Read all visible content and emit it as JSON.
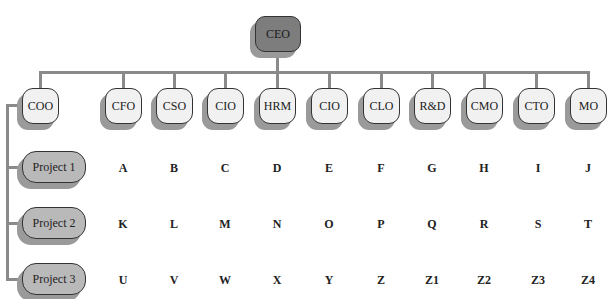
{
  "chart": {
    "root": {
      "label": "CEO",
      "color": "#7d7d7d"
    },
    "roles": [
      {
        "label": "COO",
        "x": 22
      },
      {
        "label": "CFO",
        "x": 105
      },
      {
        "label": "CSO",
        "x": 156
      },
      {
        "label": "CIO",
        "x": 207
      },
      {
        "label": "HRM",
        "x": 259
      },
      {
        "label": "CIO",
        "x": 311
      },
      {
        "label": "CLO",
        "x": 363
      },
      {
        "label": "R&D",
        "x": 414
      },
      {
        "label": "CMO",
        "x": 466
      },
      {
        "label": "CTO",
        "x": 518
      },
      {
        "label": "MO",
        "x": 570
      }
    ],
    "projects": [
      {
        "label": "Project 1",
        "cells": [
          "A",
          "B",
          "C",
          "D",
          "E",
          "F",
          "G",
          "H",
          "I",
          "J"
        ]
      },
      {
        "label": "Project 2",
        "cells": [
          "K",
          "L",
          "M",
          "N",
          "O",
          "P",
          "Q",
          "R",
          "S",
          "T"
        ]
      },
      {
        "label": "Project 3",
        "cells": [
          "U",
          "V",
          "W",
          "X",
          "Y",
          "Z",
          "Z1",
          "Z2",
          "Z3",
          "Z4"
        ]
      }
    ],
    "colors": {
      "line": "#8a8a8a",
      "role_fill": "#f1f1f1",
      "project_fill": "#b9b9b9",
      "shadow": "#9a9a9a"
    }
  }
}
